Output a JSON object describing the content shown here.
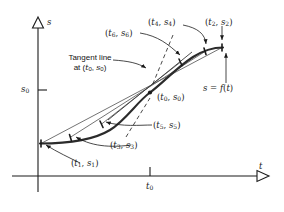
{
  "figure": {
    "background_color": "#ffffff",
    "ink_color": "#1a1a1a",
    "curve_color": "#2b2b2b",
    "secant_color": "#555555"
  },
  "axes": {
    "y_label": "s",
    "x_label": "t",
    "y_tick_label": "s₀",
    "x_tick_label": "t₀",
    "y_tick_text": "s",
    "y_tick_sub": "0",
    "x_tick_text": "t",
    "x_tick_sub": "0",
    "arrowhead_style": "hollow-triangle",
    "origin_px": [
      38,
      176
    ],
    "y_axis_top_px": 18,
    "x_axis_right_px": 272
  },
  "labels": {
    "tangent_line": {
      "line1": "Tangent line",
      "line2_prefix": "at (",
      "line2_t": "t",
      "line2_tsub": "0",
      "line2_mid": ", ",
      "line2_s": "s",
      "line2_ssub": "0",
      "line2_suffix": ")"
    },
    "function_label": {
      "s": "s",
      "eq": " = ",
      "f": "f",
      "paren_open": "(",
      "t": "t",
      "paren_close": ")"
    },
    "points": [
      {
        "id": "p1",
        "text": "(t₁, s₁)",
        "t": "t",
        "tsub": "1",
        "s": "s",
        "ssub": "1"
      },
      {
        "id": "p2",
        "text": "(t₂, s₂)",
        "t": "t",
        "tsub": "2",
        "s": "s",
        "ssub": "2"
      },
      {
        "id": "p3",
        "text": "(t₃, s₃)",
        "t": "t",
        "tsub": "3",
        "s": "s",
        "ssub": "3"
      },
      {
        "id": "p4",
        "text": "(t₄, s₄)",
        "t": "t",
        "tsub": "4",
        "s": "s",
        "ssub": "4"
      },
      {
        "id": "p5",
        "text": "(t₅, s₅)",
        "t": "t",
        "tsub": "5",
        "s": "s",
        "ssub": "5"
      },
      {
        "id": "p6",
        "text": "(t₆, s₆)",
        "t": "t",
        "tsub": "6",
        "s": "s",
        "ssub": "6"
      },
      {
        "id": "p0",
        "text": "(t₀, s₀)",
        "t": "t",
        "tsub": "0",
        "s": "s",
        "ssub": "0"
      }
    ]
  },
  "geometry": {
    "curve_path": "M 40 143 C 70 143 96 140 112 128 C 128 116 138 100 150 92 C 162 84 176 68 192 57 C 204 49 214 47 223 47",
    "center_point_px": [
      150,
      92
    ],
    "secants": [
      {
        "name": "secant-1-2",
        "x1": 41,
        "y1": 143.5,
        "x2": 222,
        "y2": 47.5
      },
      {
        "name": "secant-3-4",
        "x1": 70,
        "y1": 137.5,
        "x2": 205,
        "y2": 51.5
      },
      {
        "name": "secant-5-6",
        "x1": 101,
        "y1": 124.5,
        "x2": 180,
        "y2": 62.5
      },
      {
        "name": "tangent",
        "x1": 113,
        "y1": 117.5,
        "x2": 176,
        "y2": 66.5
      }
    ],
    "marked_points": [
      {
        "name": "point-t1",
        "x": 41,
        "y": 143
      },
      {
        "name": "point-t3",
        "x": 70,
        "y": 137
      },
      {
        "name": "point-t5",
        "x": 101,
        "y": 124
      },
      {
        "name": "point-t0",
        "x": 150,
        "y": 92
      },
      {
        "name": "point-t6",
        "x": 180,
        "y": 62
      },
      {
        "name": "point-t4",
        "x": 205,
        "y": 51
      },
      {
        "name": "point-t2",
        "x": 222,
        "y": 47
      }
    ]
  }
}
